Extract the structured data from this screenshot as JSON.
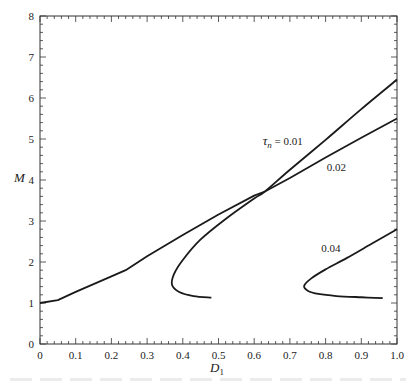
{
  "chart_data": {
    "type": "line",
    "title": "",
    "xlabel": "D1",
    "xlabel_main": "D",
    "xlabel_sub": "1",
    "ylabel": "M",
    "xlim": [
      0,
      1.0
    ],
    "ylim": [
      0,
      8
    ],
    "x_ticks": [
      0,
      0.1,
      0.2,
      0.3,
      0.4,
      0.5,
      0.6,
      0.7,
      0.8,
      0.9,
      1.0
    ],
    "x_tick_labels": [
      "0",
      "0.1",
      "0.2",
      "0.3",
      "0.4",
      "0.5",
      "0.6",
      "0.7",
      "0.8",
      "0.9",
      "1.0"
    ],
    "y_ticks": [
      0,
      1,
      2,
      3,
      4,
      5,
      6,
      7,
      8
    ],
    "y_tick_labels": [
      "0",
      "1",
      "2",
      "3",
      "4",
      "5",
      "6",
      "7",
      "8"
    ],
    "x_minor_step": 0.02,
    "y_minor_step": 0.2,
    "grid": false,
    "legend": "inline curve labels",
    "series": [
      {
        "name": "τn = 0.01",
        "label_text": "τ",
        "label_sub": "n",
        "label_value": " = 0.01",
        "label_pos": [
          0.68,
          4.85
        ],
        "points": [
          [
            0.48,
            1.13
          ],
          [
            0.43,
            1.17
          ],
          [
            0.39,
            1.27
          ],
          [
            0.37,
            1.44
          ],
          [
            0.375,
            1.7
          ],
          [
            0.4,
            2.05
          ],
          [
            0.45,
            2.55
          ],
          [
            0.52,
            3.05
          ],
          [
            0.6,
            3.55
          ],
          [
            0.63,
            3.72
          ],
          [
            0.7,
            4.25
          ],
          [
            0.8,
            4.98
          ],
          [
            0.9,
            5.73
          ],
          [
            1.0,
            6.45
          ]
        ]
      },
      {
        "name": "τn = 0.02",
        "label_text": "0.02",
        "label_pos": [
          0.83,
          4.22
        ],
        "points": [
          [
            0.0,
            1.0
          ],
          [
            0.05,
            1.07
          ],
          [
            0.1,
            1.27
          ],
          [
            0.15,
            1.46
          ],
          [
            0.2,
            1.65
          ],
          [
            0.24,
            1.8
          ],
          [
            0.3,
            2.14
          ],
          [
            0.4,
            2.66
          ],
          [
            0.5,
            3.16
          ],
          [
            0.6,
            3.62
          ],
          [
            0.63,
            3.72
          ],
          [
            0.7,
            4.05
          ],
          [
            0.8,
            4.55
          ],
          [
            0.9,
            5.03
          ],
          [
            1.0,
            5.5
          ]
        ]
      },
      {
        "name": "τn = 0.04",
        "label_text": "0.04",
        "label_pos": [
          0.815,
          2.25
        ],
        "points": [
          [
            0.96,
            1.12
          ],
          [
            0.9,
            1.14
          ],
          [
            0.83,
            1.17
          ],
          [
            0.78,
            1.22
          ],
          [
            0.75,
            1.3
          ],
          [
            0.74,
            1.42
          ],
          [
            0.76,
            1.6
          ],
          [
            0.8,
            1.82
          ],
          [
            0.86,
            2.1
          ],
          [
            0.93,
            2.45
          ],
          [
            1.0,
            2.8
          ]
        ]
      }
    ]
  },
  "plot_area": {
    "left": 40,
    "top": 16,
    "right": 397,
    "bottom": 344
  },
  "colors": {
    "line": "#1a1a1a",
    "axis": "#333333",
    "text": "#222222",
    "background": "#ffffff"
  }
}
